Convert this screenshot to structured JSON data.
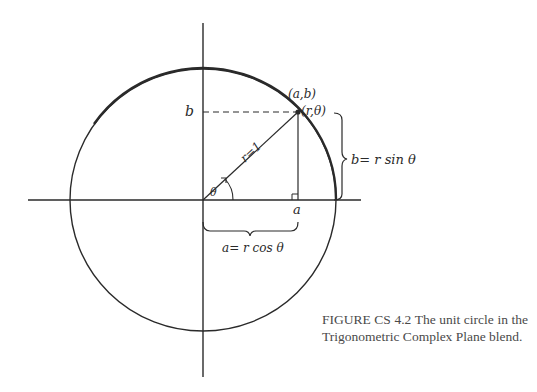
{
  "figure": {
    "labels": {
      "point_cartesian": "(a,b)",
      "point_polar": "(r,θ)",
      "b_axis_label": "b",
      "a_axis_label": "a",
      "radius_label": "r=1",
      "angle_label": "θ",
      "b_formula": "b= r sin θ",
      "a_formula": "a= r cos θ"
    },
    "colors": {
      "ink": "#2a2a2a",
      "caption_text": "#4a4a4a",
      "background": "#ffffff"
    }
  },
  "caption": {
    "line1": "FIGURE CS 4.2  The unit circle in the",
    "line2": "Trigonometric Complex Plane blend."
  }
}
